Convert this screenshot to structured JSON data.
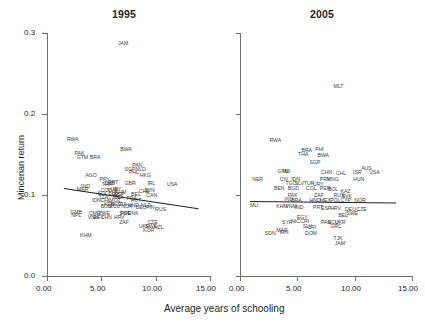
{
  "figure": {
    "xlabel": "Average years of schooling",
    "ylabel": "Mincerian return"
  },
  "axes": {
    "x_ticks": [
      "0.00",
      "5.00",
      "10.00",
      "15.00"
    ],
    "y_ticks": [
      "0.3",
      "0.2",
      "0.1",
      "0.0"
    ]
  },
  "chart_data": {
    "type": "scatter",
    "title": "",
    "xlabel": "Average years of schooling",
    "ylabel": "Mincerian return",
    "xlim": [
      0,
      15
    ],
    "ylim": [
      0,
      0.3
    ],
    "xticks": [
      0,
      5,
      10,
      15
    ],
    "yticks": [
      0,
      0.1,
      0.2,
      0.3
    ],
    "grid": false,
    "legend": false,
    "point_labels": "ISO3 country codes",
    "panels": [
      {
        "name": "panel-1995",
        "title": "1995",
        "fit_line": {
          "x0": 1.6,
          "y0": 0.1085,
          "x1": 14.0,
          "y1": 0.0835
        },
        "points": [
          {
            "label": "JAM",
            "x": 7.0,
            "y": 0.286
          },
          {
            "label": "RWA",
            "x": 2.3,
            "y": 0.168
          },
          {
            "label": "PAK",
            "x": 3.0,
            "y": 0.151
          },
          {
            "label": "GTM",
            "x": 3.2,
            "y": 0.146
          },
          {
            "label": "BRA",
            "x": 4.4,
            "y": 0.146
          },
          {
            "label": "BWA",
            "x": 7.2,
            "y": 0.155
          },
          {
            "label": "PAN",
            "x": 8.3,
            "y": 0.136
          },
          {
            "label": "SGP",
            "x": 7.6,
            "y": 0.131
          },
          {
            "label": "NLD",
            "x": 8.6,
            "y": 0.131
          },
          {
            "label": "PHL",
            "x": 8.0,
            "y": 0.127
          },
          {
            "label": "HKG",
            "x": 9.0,
            "y": 0.123
          },
          {
            "label": "AGO",
            "x": 4.0,
            "y": 0.124
          },
          {
            "label": "PRY",
            "x": 5.3,
            "y": 0.118
          },
          {
            "label": "PRT",
            "x": 6.1,
            "y": 0.115
          },
          {
            "label": "ZMB",
            "x": 5.7,
            "y": 0.114
          },
          {
            "label": "THA",
            "x": 5.5,
            "y": 0.112
          },
          {
            "label": "IND",
            "x": 3.6,
            "y": 0.11
          },
          {
            "label": "GBR",
            "x": 7.6,
            "y": 0.113
          },
          {
            "label": "IRL",
            "x": 9.7,
            "y": 0.114
          },
          {
            "label": "USA",
            "x": 11.5,
            "y": 0.112
          },
          {
            "label": "MAR",
            "x": 3.2,
            "y": 0.106
          },
          {
            "label": "COL",
            "x": 5.4,
            "y": 0.105
          },
          {
            "label": "URY",
            "x": 6.3,
            "y": 0.106
          },
          {
            "label": "TUR",
            "x": 6.0,
            "y": 0.105
          },
          {
            "label": "KHM",
            "x": 6.7,
            "y": 0.103
          },
          {
            "label": "CHE",
            "x": 8.9,
            "y": 0.104
          },
          {
            "label": "SVN",
            "x": 9.4,
            "y": 0.105
          },
          {
            "label": "SLV",
            "x": 5.1,
            "y": 0.101
          },
          {
            "label": "PER",
            "x": 6.1,
            "y": 0.1
          },
          {
            "label": "ESP",
            "x": 6.6,
            "y": 0.1
          },
          {
            "label": "BEL",
            "x": 8.2,
            "y": 0.1
          },
          {
            "label": "CAN",
            "x": 9.6,
            "y": 0.099
          },
          {
            "label": "TZA",
            "x": 5.2,
            "y": 0.096
          },
          {
            "label": "MEX",
            "x": 6.5,
            "y": 0.096
          },
          {
            "label": "FRA",
            "x": 7.8,
            "y": 0.095
          },
          {
            "label": "IDN",
            "x": 4.6,
            "y": 0.092
          },
          {
            "label": "CHL",
            "x": 5.4,
            "y": 0.092
          },
          {
            "label": "MOZ",
            "x": 6.2,
            "y": 0.092
          },
          {
            "label": "AUT",
            "x": 8.2,
            "y": 0.092
          },
          {
            "label": "KEN",
            "x": 5.7,
            "y": 0.088
          },
          {
            "label": "BGD",
            "x": 6.3,
            "y": 0.088
          },
          {
            "label": "ITA",
            "x": 7.1,
            "y": 0.088
          },
          {
            "label": "HND",
            "x": 7.9,
            "y": 0.087
          },
          {
            "label": "NLD",
            "x": 9.1,
            "y": 0.086
          },
          {
            "label": "BOL",
            "x": 5.4,
            "y": 0.085
          },
          {
            "label": "ECU",
            "x": 6.2,
            "y": 0.085
          },
          {
            "label": "NOR",
            "x": 7.3,
            "y": 0.085
          },
          {
            "label": "DEU",
            "x": 8.6,
            "y": 0.084
          },
          {
            "label": "FIN",
            "x": 9.6,
            "y": 0.084
          },
          {
            "label": "RUS",
            "x": 10.4,
            "y": 0.082
          },
          {
            "label": "GMB",
            "x": 2.6,
            "y": 0.078
          },
          {
            "label": "NPL",
            "x": 2.7,
            "y": 0.074
          },
          {
            "label": "CMR",
            "x": 4.3,
            "y": 0.076
          },
          {
            "label": "ZWE",
            "x": 5.2,
            "y": 0.076
          },
          {
            "label": "SWE",
            "x": 7.1,
            "y": 0.077
          },
          {
            "label": "DNK",
            "x": 7.9,
            "y": 0.077
          },
          {
            "label": "POL",
            "x": 7.2,
            "y": 0.076
          },
          {
            "label": "HRV",
            "x": 6.6,
            "y": 0.072
          },
          {
            "label": "VNM",
            "x": 4.2,
            "y": 0.071
          },
          {
            "label": "EGY",
            "x": 4.7,
            "y": 0.072
          },
          {
            "label": "CHN",
            "x": 5.4,
            "y": 0.071
          },
          {
            "label": "ZAF",
            "x": 7.1,
            "y": 0.066
          },
          {
            "label": "CZE",
            "x": 9.7,
            "y": 0.066
          },
          {
            "label": "UKR",
            "x": 8.9,
            "y": 0.061
          },
          {
            "label": "SWE",
            "x": 9.5,
            "y": 0.061
          },
          {
            "label": "NZL",
            "x": 10.3,
            "y": 0.059
          },
          {
            "label": "KOR",
            "x": 9.3,
            "y": 0.055
          },
          {
            "label": "KHM",
            "x": 3.5,
            "y": 0.05
          }
        ]
      },
      {
        "name": "panel-2005",
        "title": "2005",
        "fit_line": {
          "x0": 0.9,
          "y0": 0.0925,
          "x1": 13.6,
          "y1": 0.0905
        },
        "points": [
          {
            "label": "MLT",
            "x": 8.6,
            "y": 0.233
          },
          {
            "label": "RWA",
            "x": 3.0,
            "y": 0.167
          },
          {
            "label": "BRA",
            "x": 5.8,
            "y": 0.154
          },
          {
            "label": "PHI",
            "x": 7.0,
            "y": 0.155
          },
          {
            "label": "THA",
            "x": 5.5,
            "y": 0.15
          },
          {
            "label": "BWA",
            "x": 7.2,
            "y": 0.148
          },
          {
            "label": "SGP",
            "x": 6.5,
            "y": 0.14
          },
          {
            "label": "AUS",
            "x": 11.0,
            "y": 0.132
          },
          {
            "label": "GTM",
            "x": 3.7,
            "y": 0.129
          },
          {
            "label": "MLI",
            "x": 4.1,
            "y": 0.129
          },
          {
            "label": "CHN",
            "x": 7.5,
            "y": 0.127
          },
          {
            "label": "CHL",
            "x": 8.8,
            "y": 0.126
          },
          {
            "label": "ISR",
            "x": 10.3,
            "y": 0.127
          },
          {
            "label": "USA",
            "x": 11.7,
            "y": 0.127
          },
          {
            "label": "NER",
            "x": 1.5,
            "y": 0.119
          },
          {
            "label": "CIV",
            "x": 3.9,
            "y": 0.119
          },
          {
            "label": "IDN",
            "x": 4.9,
            "y": 0.119
          },
          {
            "label": "MNG",
            "x": 8.0,
            "y": 0.119
          },
          {
            "label": "PRY",
            "x": 7.4,
            "y": 0.118
          },
          {
            "label": "HUN",
            "x": 10.3,
            "y": 0.118
          },
          {
            "label": "TGO",
            "x": 4.4,
            "y": 0.114
          },
          {
            "label": "SLV",
            "x": 5.2,
            "y": 0.114
          },
          {
            "label": "TUR",
            "x": 6.0,
            "y": 0.113
          },
          {
            "label": "URY",
            "x": 6.8,
            "y": 0.112
          },
          {
            "label": "BEN",
            "x": 3.4,
            "y": 0.107
          },
          {
            "label": "BGD",
            "x": 4.6,
            "y": 0.107
          },
          {
            "label": "COL",
            "x": 6.2,
            "y": 0.107
          },
          {
            "label": "PER",
            "x": 7.4,
            "y": 0.107
          },
          {
            "label": "BOL",
            "x": 8.1,
            "y": 0.106
          },
          {
            "label": "KAZ",
            "x": 9.2,
            "y": 0.104
          },
          {
            "label": "PAK",
            "x": 4.6,
            "y": 0.099
          },
          {
            "label": "ZAF",
            "x": 6.9,
            "y": 0.099
          },
          {
            "label": "RUS",
            "x": 8.6,
            "y": 0.099
          },
          {
            "label": "SVK",
            "x": 9.3,
            "y": 0.098
          },
          {
            "label": "IND",
            "x": 4.3,
            "y": 0.094
          },
          {
            "label": "BRA",
            "x": 4.9,
            "y": 0.093
          },
          {
            "label": "HND",
            "x": 6.5,
            "y": 0.092
          },
          {
            "label": "MEX",
            "x": 7.4,
            "y": 0.092
          },
          {
            "label": "POL",
            "x": 8.3,
            "y": 0.092
          },
          {
            "label": "CYP",
            "x": 9.2,
            "y": 0.092
          },
          {
            "label": "NOR",
            "x": 10.4,
            "y": 0.092
          },
          {
            "label": "MLI",
            "x": 1.3,
            "y": 0.087
          },
          {
            "label": "KHM",
            "x": 3.6,
            "y": 0.085
          },
          {
            "label": "VNM",
            "x": 4.4,
            "y": 0.085
          },
          {
            "label": "IND",
            "x": 5.2,
            "y": 0.084
          },
          {
            "label": "PRT",
            "x": 6.8,
            "y": 0.084
          },
          {
            "label": "ESP",
            "x": 7.5,
            "y": 0.083
          },
          {
            "label": "HRV",
            "x": 8.3,
            "y": 0.083
          },
          {
            "label": "DEU",
            "x": 9.6,
            "y": 0.082
          },
          {
            "label": "CZE",
            "x": 10.6,
            "y": 0.081
          },
          {
            "label": "SWE",
            "x": 9.7,
            "y": 0.077
          },
          {
            "label": "BEL",
            "x": 9.0,
            "y": 0.074
          },
          {
            "label": "EGY",
            "x": 5.4,
            "y": 0.071
          },
          {
            "label": "NIC",
            "x": 4.9,
            "y": 0.067
          },
          {
            "label": "CRI",
            "x": 5.7,
            "y": 0.067
          },
          {
            "label": "SYR",
            "x": 4.1,
            "y": 0.065
          },
          {
            "label": "PAN",
            "x": 7.5,
            "y": 0.066
          },
          {
            "label": "ECU",
            "x": 8.1,
            "y": 0.066
          },
          {
            "label": "UKR",
            "x": 8.7,
            "y": 0.066
          },
          {
            "label": "GRC",
            "x": 8.3,
            "y": 0.061
          },
          {
            "label": "SLV",
            "x": 5.9,
            "y": 0.06
          },
          {
            "label": "CRI",
            "x": 6.3,
            "y": 0.059
          },
          {
            "label": "MAR",
            "x": 3.6,
            "y": 0.056
          },
          {
            "label": "SDN",
            "x": 2.6,
            "y": 0.052
          },
          {
            "label": "IRN",
            "x": 3.9,
            "y": 0.053
          },
          {
            "label": "DOM",
            "x": 6.1,
            "y": 0.052
          },
          {
            "label": "TJK",
            "x": 8.6,
            "y": 0.046
          },
          {
            "label": "JAM",
            "x": 8.7,
            "y": 0.04
          }
        ]
      }
    ]
  }
}
